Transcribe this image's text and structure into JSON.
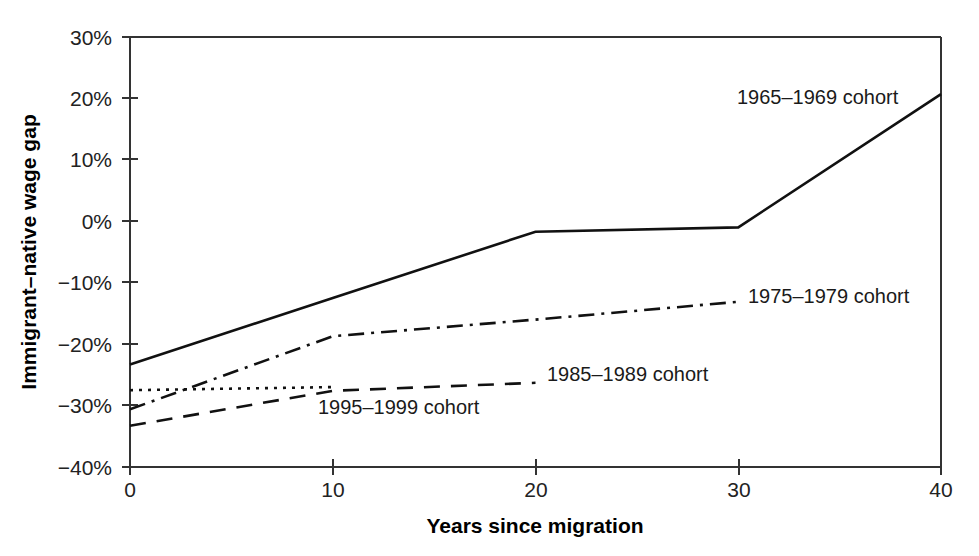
{
  "chart_data": {
    "type": "line",
    "title": "",
    "xlabel": "Years since migration",
    "ylabel": "Immigrant–native wage gap",
    "xlim": [
      0,
      40
    ],
    "ylim": [
      -40,
      30
    ],
    "grid": false,
    "legend_position": "inline-labels",
    "x_ticks": [
      0,
      10,
      20,
      30,
      40
    ],
    "x_tick_labels": [
      "0",
      "10",
      "20",
      "30",
      "40"
    ],
    "y_ticks": [
      30,
      20,
      10,
      0,
      -10,
      -20,
      -30,
      -40
    ],
    "y_tick_labels": [
      "30%",
      "20%",
      "10%",
      "0%",
      "−10%",
      "−20%",
      "−30%",
      "−40%"
    ],
    "series": [
      {
        "name": "1965–1969 cohort",
        "style": "solid",
        "x": [
          0,
          10,
          20,
          30,
          40
        ],
        "values": [
          -23.3,
          -12.5,
          -1.7,
          -1.0,
          20.7
        ],
        "label": "1965–1969 cohort",
        "label_x": 737,
        "label_y": 104
      },
      {
        "name": "1975–1979 cohort",
        "style": "dash-dot",
        "x": [
          0,
          10,
          20,
          30
        ],
        "values": [
          -30.6,
          -18.7,
          -16.0,
          -13.1
        ],
        "label": "1975–1979 cohort",
        "label_x": 748,
        "label_y": 303
      },
      {
        "name": "1985–1989 cohort",
        "style": "dashed",
        "x": [
          0,
          10,
          20
        ],
        "values": [
          -33.3,
          -27.6,
          -26.3
        ],
        "label": "1985–1989 cohort",
        "label_x": 547,
        "label_y": 381
      },
      {
        "name": "1995–1999 cohort",
        "style": "dotted",
        "x": [
          0,
          10
        ],
        "values": [
          -27.5,
          -27.0
        ],
        "label": "1995–1999 cohort",
        "label_x": 318,
        "label_y": 414
      }
    ]
  },
  "axis": {
    "x_title": "Years since migration",
    "y_title": "Immigrant–native wage gap"
  },
  "ticks": {
    "y": [
      "30%",
      "20%",
      "10%",
      "0%",
      "−10%",
      "−20%",
      "−30%",
      "−40%"
    ],
    "x": [
      "0",
      "10",
      "20",
      "30",
      "40"
    ]
  },
  "labels": {
    "cohort_1965": "1965–1969 cohort",
    "cohort_1975": "1975–1979 cohort",
    "cohort_1985": "1985–1989 cohort",
    "cohort_1995": "1995–1999 cohort"
  },
  "colors": {
    "line": "#111111",
    "axis": "#333333",
    "text": "#1a1a1a",
    "background": "#ffffff"
  }
}
